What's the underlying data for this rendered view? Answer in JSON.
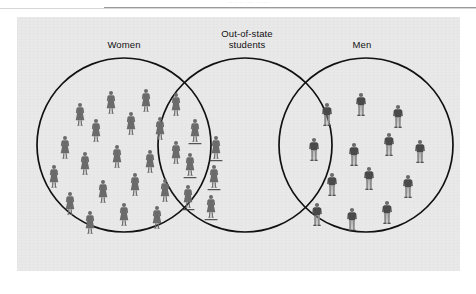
{
  "page": {
    "top_remnant_text": "··  ····  ··· ······",
    "background_color": "#ffffff"
  },
  "figure": {
    "panel_background": "#e9e9e9",
    "stroke_color": "#111111",
    "figure_color": "#6b6b6b",
    "type": "venn-diagram",
    "sets": [
      {
        "id": "women",
        "label": "Women",
        "label_lines": [
          "Women"
        ],
        "cx": 107,
        "cy": 128,
        "r": 87,
        "count_visible": 20
      },
      {
        "id": "out-of-state-students",
        "label": "Out-of-state students",
        "label_lines": [
          "Out-of-state",
          "students"
        ],
        "cx": 228,
        "cy": 128,
        "r": 87,
        "count_visible": 6
      },
      {
        "id": "men",
        "label": "Men",
        "label_lines": [
          "Men"
        ],
        "cx": 349,
        "cy": 128,
        "r": 87,
        "count_visible": 13
      }
    ],
    "regions": [
      {
        "id": "women-only",
        "sets": [
          "women"
        ],
        "figure_type": "woman",
        "count": 20
      },
      {
        "id": "women-and-out-of-state",
        "sets": [
          "women",
          "out-of-state-students"
        ],
        "figure_type": "woman-underlined",
        "count": 6
      },
      {
        "id": "out-of-state-only",
        "sets": [
          "out-of-state-students"
        ],
        "figure_type": "none",
        "count": 0
      },
      {
        "id": "men-and-out-of-state",
        "sets": [
          "men",
          "out-of-state-students"
        ],
        "figure_type": "none",
        "count": 0
      },
      {
        "id": "men-only",
        "sets": [
          "men"
        ],
        "figure_type": "man",
        "count": 13
      }
    ],
    "people": {
      "women_only": [
        {
          "x": 63,
          "y": 98
        },
        {
          "x": 94,
          "y": 86
        },
        {
          "x": 129,
          "y": 84
        },
        {
          "x": 159,
          "y": 88
        },
        {
          "x": 48,
          "y": 131
        },
        {
          "x": 79,
          "y": 114
        },
        {
          "x": 114,
          "y": 107
        },
        {
          "x": 143,
          "y": 112
        },
        {
          "x": 37,
          "y": 160
        },
        {
          "x": 68,
          "y": 147
        },
        {
          "x": 100,
          "y": 140
        },
        {
          "x": 133,
          "y": 145
        },
        {
          "x": 159,
          "y": 136
        },
        {
          "x": 53,
          "y": 187
        },
        {
          "x": 86,
          "y": 175
        },
        {
          "x": 118,
          "y": 168
        },
        {
          "x": 148,
          "y": 174
        },
        {
          "x": 73,
          "y": 206
        },
        {
          "x": 107,
          "y": 198
        },
        {
          "x": 140,
          "y": 201
        }
      ],
      "women_out_of_state": [
        {
          "x": 178,
          "y": 114
        },
        {
          "x": 199,
          "y": 131
        },
        {
          "x": 173,
          "y": 148
        },
        {
          "x": 197,
          "y": 160
        },
        {
          "x": 171,
          "y": 180
        },
        {
          "x": 194,
          "y": 190
        }
      ],
      "men_only": [
        {
          "x": 310,
          "y": 98
        },
        {
          "x": 344,
          "y": 88
        },
        {
          "x": 381,
          "y": 100
        },
        {
          "x": 297,
          "y": 133
        },
        {
          "x": 337,
          "y": 138
        },
        {
          "x": 372,
          "y": 128
        },
        {
          "x": 403,
          "y": 135
        },
        {
          "x": 315,
          "y": 168
        },
        {
          "x": 352,
          "y": 162
        },
        {
          "x": 391,
          "y": 170
        },
        {
          "x": 300,
          "y": 198
        },
        {
          "x": 335,
          "y": 203
        },
        {
          "x": 370,
          "y": 196
        }
      ]
    }
  }
}
